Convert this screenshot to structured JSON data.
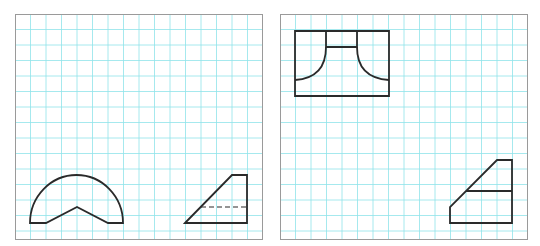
{
  "figure": {
    "grid_color": "#8fe3ea",
    "line_color": "#2a2a2a",
    "border_color": "#9a9a9a",
    "grid_spacing_px": 15.5,
    "panels": [
      {
        "id": "left",
        "x": 15,
        "y": 14,
        "w": 248,
        "h": 226,
        "shapes": [
          {
            "name": "semicircle-with-v-notch",
            "type": "path",
            "d": "M30,223 A46.5,48 0 0 1 123,223 L108,223 L77,207 L46,223 Z"
          },
          {
            "name": "trapezoid-solid",
            "type": "path",
            "d": "M185,223 L232,175 L247,175 L247,223 Z"
          },
          {
            "name": "hidden-line",
            "type": "dashed",
            "d": "M201,207 L247,207"
          }
        ]
      },
      {
        "id": "right",
        "x": 280,
        "y": 14,
        "w": 248,
        "h": 226,
        "shapes": [
          {
            "name": "outer-rectangle",
            "type": "path",
            "d": "M295,31 L389,31 L389,96 L295,96 Z"
          },
          {
            "name": "top-slot",
            "type": "path",
            "d": "M326,31 L326,47 L357,47 L357,31"
          },
          {
            "name": "left-arc",
            "type": "path",
            "d": "M326,47 Q326,78 295,80"
          },
          {
            "name": "right-arc",
            "type": "path",
            "d": "M357,47 Q357,78 389,80"
          },
          {
            "name": "stepped-trapezoid",
            "type": "path",
            "d": "M450,223 L450,207 L497,160 L512,160 L512,223 Z"
          },
          {
            "name": "division-line",
            "type": "path",
            "d": "M466,191 L512,191"
          }
        ]
      }
    ]
  }
}
